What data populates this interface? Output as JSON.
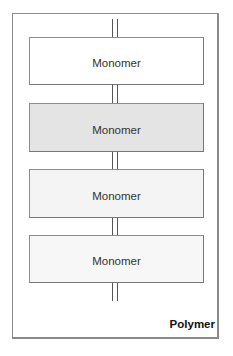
{
  "diagram": {
    "label": "Polymer",
    "monomers": [
      {
        "label": "Monomer",
        "fill": "#ffffff"
      },
      {
        "label": "Monomer",
        "fill": "#e4e4e4"
      },
      {
        "label": "Monomer",
        "fill": "#f4f4f4"
      },
      {
        "label": "Monomer",
        "fill": "#f7f7f7"
      }
    ],
    "colors": {
      "border": "#8a8a8a",
      "bond": "#555555"
    }
  }
}
